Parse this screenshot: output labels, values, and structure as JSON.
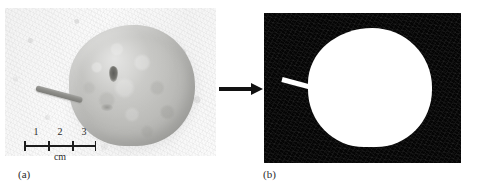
{
  "figure": {
    "panels": [
      {
        "id": "a",
        "caption": "(a)",
        "kind": "photograph",
        "subject": "fruit-with-stem",
        "background_color": "#f7f7f7",
        "fruit_color": "#bfbfbc",
        "stem_color": "#8e8e8a"
      },
      {
        "id": "b",
        "caption": "(b)",
        "kind": "binary-mask",
        "subject": "segmented-fruit-silhouette",
        "background_color": "#050505",
        "foreground_color": "#ffffff"
      }
    ],
    "arrow": {
      "name": "transformation-arrow",
      "direction": "right",
      "color": "#111111"
    },
    "scale_bar": {
      "unit_label": "cm",
      "tick_labels": [
        "1",
        "2",
        "3"
      ],
      "tick_positions_px": [
        0,
        24,
        48,
        72
      ],
      "label_positions_px": [
        12,
        36,
        60
      ],
      "total_length_px": 72,
      "intervals": 3,
      "color": "#1d1d1d"
    }
  }
}
